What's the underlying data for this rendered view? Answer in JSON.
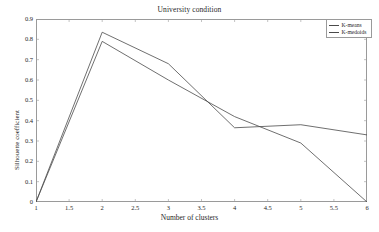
{
  "chart_data": {
    "type": "line",
    "title": "University condition",
    "xlabel": "Number of clusters",
    "ylabel": "Silhouette coefficient",
    "xlim": [
      1,
      6
    ],
    "ylim": [
      0,
      0.9
    ],
    "grid": false,
    "legend_position": "top-right",
    "xticks": [
      "1",
      "1.5",
      "2",
      "2.5",
      "3",
      "3.5",
      "4",
      "4.5",
      "5",
      "5.5",
      "6"
    ],
    "xtick_values": [
      1,
      1.5,
      2,
      2.5,
      3,
      3.5,
      4,
      4.5,
      5,
      5.5,
      6
    ],
    "yticks": [
      "0",
      "0.1",
      "0.2",
      "0.3",
      "0.4",
      "0.5",
      "0.6",
      "0.7",
      "0.8",
      "0.9"
    ],
    "ytick_values": [
      0,
      0.1,
      0.2,
      0.3,
      0.4,
      0.5,
      0.6,
      0.7,
      0.8,
      0.9
    ],
    "x": [
      1,
      2,
      3,
      4,
      5,
      6
    ],
    "series": [
      {
        "name": "K-means",
        "color": "#4a4a4a",
        "values": [
          0.0,
          0.835,
          0.68,
          0.365,
          0.38,
          0.33
        ]
      },
      {
        "name": "K-medoids",
        "color": "#4a4a4a",
        "values": [
          0.0,
          0.79,
          0.6,
          0.42,
          0.29,
          0.0
        ]
      }
    ]
  },
  "legend": {
    "items": [
      {
        "label": "K-means"
      },
      {
        "label": "K-medoids"
      }
    ]
  },
  "colors": {
    "line": "#4a4a4a",
    "axis": "#9a9a9a",
    "text": "#1f1f1f",
    "background": "#ffffff"
  }
}
